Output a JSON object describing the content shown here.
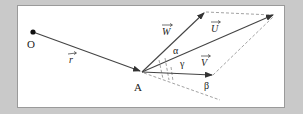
{
  "diagram": {
    "points": {
      "O": {
        "label": "O",
        "x": 33,
        "y": 32
      },
      "A": {
        "label": "A",
        "x": 142,
        "y": 72
      }
    },
    "vectors": [
      {
        "name": "r",
        "label": "r",
        "from": "O",
        "to": "A"
      },
      {
        "name": "W",
        "label": "W",
        "from": "A",
        "tip": [
          205,
          12
        ]
      },
      {
        "name": "U",
        "label": "U",
        "from": "A",
        "tip": [
          275,
          15
        ]
      },
      {
        "name": "V",
        "label": "V",
        "from": "A",
        "tip": [
          213,
          75
        ]
      }
    ],
    "angles": {
      "alpha": "α",
      "gamma": "γ",
      "beta": "β"
    },
    "colors": {
      "line": "#444444",
      "dashed": "#888888",
      "background": "#c9c9c9",
      "panel": "#ffffff"
    }
  }
}
